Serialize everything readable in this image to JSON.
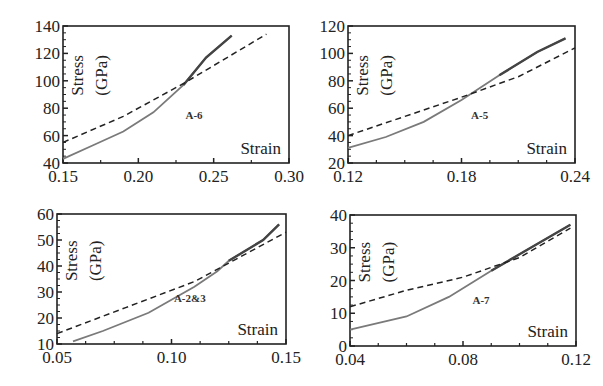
{
  "figure": {
    "background": "#ffffff",
    "line_color": "#333333",
    "solid_color": "#7a7a7a",
    "solid_end_color": "#444444"
  },
  "chart_data": [
    {
      "type": "line",
      "panel_label": "A-6",
      "xlabel": "Strain",
      "ylabel": "Stress (GPa)",
      "xlim": [
        0.15,
        0.3
      ],
      "ylim": [
        40,
        140
      ],
      "xticks": [
        "0.15",
        "0.20",
        "0.25",
        "0.30"
      ],
      "yticks": [
        "40",
        "60",
        "80",
        "100",
        "120",
        "140"
      ],
      "box": {
        "left": 63,
        "right": 289,
        "top": 26,
        "bottom": 163
      },
      "series": [
        {
          "name": "solid",
          "style": "solid",
          "x": [
            0.15,
            0.17,
            0.19,
            0.21,
            0.23,
            0.245,
            0.262
          ],
          "y": [
            43,
            53,
            63,
            77,
            97,
            117,
            133
          ]
        },
        {
          "name": "dashed",
          "style": "dashed",
          "x": [
            0.15,
            0.19,
            0.23,
            0.285
          ],
          "y": [
            55,
            74,
            98,
            134
          ]
        }
      ]
    },
    {
      "type": "line",
      "panel_label": "A-5",
      "xlabel": "Strain",
      "ylabel": "Stress (GPa)",
      "xlim": [
        0.12,
        0.24
      ],
      "ylim": [
        20,
        120
      ],
      "xticks": [
        "0.12",
        "0.18",
        "0.24"
      ],
      "yticks": [
        "20",
        "40",
        "60",
        "80",
        "100",
        "120"
      ],
      "box": {
        "left": 348,
        "right": 575,
        "top": 26,
        "bottom": 163
      },
      "series": [
        {
          "name": "solid",
          "style": "solid",
          "x": [
            0.12,
            0.14,
            0.16,
            0.18,
            0.2,
            0.22,
            0.235
          ],
          "y": [
            31,
            39,
            50,
            66,
            84,
            101,
            111
          ]
        },
        {
          "name": "dashed",
          "style": "dashed",
          "x": [
            0.12,
            0.15,
            0.18,
            0.21,
            0.24
          ],
          "y": [
            40,
            54,
            68,
            83,
            104
          ]
        }
      ]
    },
    {
      "type": "line",
      "panel_label": "A-2&3",
      "xlabel": "Strain",
      "ylabel": "Stress (GPa)",
      "xlim": [
        0.05,
        0.15
      ],
      "ylim": [
        10,
        60
      ],
      "xticks": [
        "0.05",
        "0.10",
        "0.15"
      ],
      "yticks": [
        "10",
        "20",
        "30",
        "40",
        "50",
        "60"
      ],
      "box": {
        "left": 57,
        "right": 286,
        "top": 214,
        "bottom": 344
      },
      "series": [
        {
          "name": "solid",
          "style": "solid",
          "x": [
            0.057,
            0.07,
            0.09,
            0.11,
            0.12,
            0.125,
            0.14,
            0.147
          ],
          "y": [
            11,
            15,
            22,
            32,
            38,
            42,
            50,
            56
          ]
        },
        {
          "name": "dashed",
          "style": "dashed",
          "x": [
            0.05,
            0.08,
            0.11,
            0.15
          ],
          "y": [
            14,
            24,
            34,
            53
          ]
        }
      ]
    },
    {
      "type": "line",
      "panel_label": "A-7",
      "xlabel": "Strain",
      "ylabel": "Stress (GPa)",
      "xlim": [
        0.04,
        0.12
      ],
      "ylim": [
        0,
        40
      ],
      "xticks": [
        "0.04",
        "0.08",
        "0.12"
      ],
      "yticks": [
        "0",
        "10",
        "20",
        "30",
        "40"
      ],
      "box": {
        "left": 350,
        "right": 576,
        "top": 215,
        "bottom": 346
      },
      "series": [
        {
          "name": "solid",
          "style": "solid",
          "x": [
            0.04,
            0.06,
            0.075,
            0.09,
            0.1,
            0.118
          ],
          "y": [
            5,
            9,
            15,
            23,
            28,
            37
          ]
        },
        {
          "name": "dashed",
          "style": "dashed",
          "x": [
            0.04,
            0.06,
            0.08,
            0.1,
            0.118
          ],
          "y": [
            12,
            17,
            21,
            27,
            36
          ]
        }
      ]
    }
  ]
}
